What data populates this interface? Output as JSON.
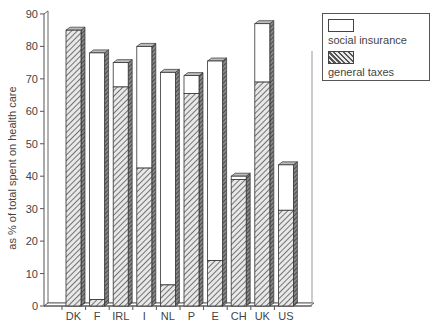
{
  "chart_data": {
    "type": "bar",
    "stacked": true,
    "style": "3d",
    "title": "",
    "xlabel": "",
    "ylabel": "as % of total spent on health care",
    "ylim": [
      0,
      90
    ],
    "yticks": [
      0,
      10,
      20,
      30,
      40,
      50,
      60,
      70,
      80,
      90
    ],
    "grid": false,
    "legend_position": "top-right",
    "categories": [
      "DK",
      "F",
      "IRL",
      "I",
      "NL",
      "P",
      "E",
      "CH",
      "UK",
      "US"
    ],
    "series": [
      {
        "name": "general taxes",
        "pattern": "hatched",
        "values": [
          85,
          2,
          67.5,
          42.5,
          6.5,
          65.5,
          14,
          39,
          69,
          29.5
        ]
      },
      {
        "name": "social insurance",
        "pattern": "white",
        "values": [
          0,
          76,
          7.5,
          37.5,
          65.5,
          5.5,
          61.5,
          1,
          18,
          14
        ]
      }
    ],
    "totals": [
      85,
      78,
      75,
      80,
      72,
      71,
      75.5,
      40,
      87,
      43.5
    ]
  },
  "legend": {
    "items": [
      {
        "label": "social insurance",
        "pattern": "white"
      },
      {
        "label": "general taxes",
        "pattern": "hatched"
      }
    ]
  },
  "axis": {
    "ylabel": "as % of total spent on health care"
  }
}
